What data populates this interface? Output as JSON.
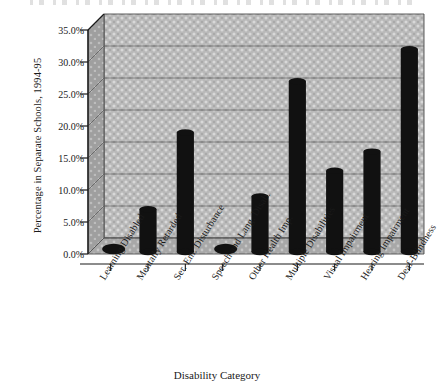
{
  "chart_data": {
    "type": "bar",
    "title": "",
    "xlabel": "Disability Category",
    "ylabel": "Percentage in Separate Schools, 1994-95",
    "categories": [
      "Learning Disabled",
      "Mentally Retarded",
      "Ser. Em. Disturbance",
      "Speech and Lang. Disab.",
      "Other Health Imp.",
      "Multiple Disabilities",
      "Visual Impairment",
      "Hearing Impairment",
      "Deaf-Blindness"
    ],
    "values": [
      1.0,
      7.0,
      19.0,
      1.0,
      9.0,
      27.0,
      13.0,
      16.0,
      32.0
    ],
    "ylim": [
      0,
      35
    ],
    "ytick_values": [
      0,
      5,
      10,
      15,
      20,
      25,
      30,
      35
    ],
    "ytick_labels": [
      "0.0%",
      "5.0%",
      "10.0%",
      "15.0%",
      "20.0%",
      "25.0%",
      "30.0%",
      "35.0%"
    ],
    "grid": true,
    "legend": false,
    "style": "3d-perspective",
    "bar_color": "#111111",
    "plot_background_color": "#b6b6b6",
    "axis_color": "#1a1a1a"
  },
  "axes": {
    "y_title": "Percentage in Separate Schools, 1994-95",
    "x_title": "Disability Category"
  }
}
